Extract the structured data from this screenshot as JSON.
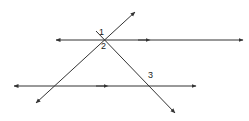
{
  "figure": {
    "stroke_color": "#333333",
    "background_color": "#ffffff",
    "labels": [
      {
        "id": "1",
        "text": "1",
        "x": 103,
        "y": 33
      },
      {
        "id": "2",
        "text": "2",
        "x": 105,
        "y": 47
      },
      {
        "id": "3",
        "text": "3",
        "x": 152,
        "y": 76
      }
    ],
    "lines": [
      {
        "name": "upper-horizontal-line",
        "kind": "horizontal",
        "x1": 56,
        "y1": 40,
        "x2": 243,
        "y2": 40,
        "arrow_start": true,
        "arrow_end": true,
        "mid_arrow_at": 0.47,
        "mid_arrow_direction": "right"
      },
      {
        "name": "lower-horizontal-line",
        "kind": "horizontal",
        "x1": 14,
        "y1": 86,
        "x2": 196,
        "y2": 86,
        "arrow_start": true,
        "arrow_end": true,
        "mid_arrow_at": 0.49,
        "mid_arrow_direction": "right"
      },
      {
        "name": "transversal-rising",
        "kind": "diagonal",
        "x1": 36,
        "y1": 103,
        "x2": 135,
        "y2": 12,
        "arrow_start": true,
        "arrow_end": true
      },
      {
        "name": "transversal-falling",
        "kind": "diagonal",
        "x1": 96,
        "y1": 31,
        "x2": 175,
        "y2": 113,
        "arrow_start": false,
        "arrow_end": true
      }
    ],
    "intersections": [
      {
        "name": "upper-intersection",
        "x": 106,
        "y": 40
      },
      {
        "name": "lower-right-intersection",
        "x": 143,
        "y": 86
      },
      {
        "name": "lower-left-intersection",
        "x": 67,
        "y": 86
      }
    ]
  }
}
